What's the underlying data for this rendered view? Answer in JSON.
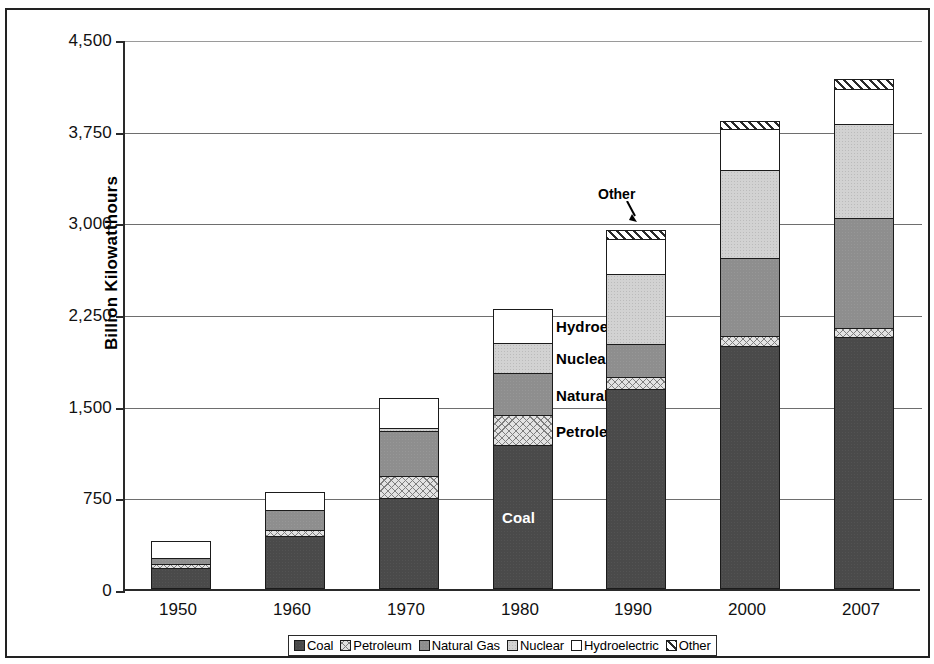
{
  "chart_data": {
    "type": "bar",
    "stacked": true,
    "title": "",
    "xlabel": "",
    "ylabel": "Billion Kilowatthours",
    "ylim": [
      0,
      4500
    ],
    "ytick_values": [
      0,
      750,
      1500,
      2250,
      3000,
      3750,
      4500
    ],
    "ytick_labels": [
      "0",
      "750",
      "1,500",
      "2,250",
      "3,000",
      "3,750",
      "4,500"
    ],
    "grid": true,
    "legend_position": "bottom",
    "categories": [
      "1950",
      "1960",
      "1970",
      "1980",
      "1990",
      "2000",
      "2007"
    ],
    "series": [
      {
        "name": "Coal",
        "values": [
          155,
          420,
          725,
          1160,
          1620,
          1970,
          2045
        ]
      },
      {
        "name": "Petroleum",
        "values": [
          35,
          50,
          185,
          245,
          100,
          85,
          75
        ]
      },
      {
        "name": "Natural Gas",
        "values": [
          45,
          160,
          370,
          345,
          265,
          635,
          900
        ]
      },
      {
        "name": "Nuclear",
        "values": [
          0,
          0,
          20,
          250,
          575,
          720,
          770
        ]
      },
      {
        "name": "Hydroelectric",
        "values": [
          140,
          145,
          245,
          275,
          290,
          335,
          285
        ]
      },
      {
        "name": "Other",
        "values": [
          0,
          0,
          0,
          0,
          70,
          70,
          85
        ]
      }
    ],
    "totals": [
      375,
      775,
      1545,
      2275,
      2920,
      3815,
      4160
    ],
    "annotations": [
      {
        "text": "Other",
        "target_category": "1990",
        "target_series": "Other"
      }
    ],
    "inline_labels": {
      "category": "1980",
      "labels": [
        "Coal",
        "Petroleum",
        "Natural Gas",
        "Nuclear",
        "Hydroelectric"
      ]
    }
  },
  "legend": {
    "items": [
      {
        "label": "Coal",
        "pattern": "solid-dark",
        "color": "#4a4a4a"
      },
      {
        "label": "Petroleum",
        "pattern": "cross-hatch",
        "color": "#e3e3e3"
      },
      {
        "label": "Natural Gas",
        "pattern": "solid-medium",
        "color": "#8e8e8e"
      },
      {
        "label": "Nuclear",
        "pattern": "stipple-light",
        "color": "#d2d2d2"
      },
      {
        "label": "Hydroelectric",
        "pattern": "empty",
        "color": "#ffffff"
      },
      {
        "label": "Other",
        "pattern": "diagonal-hatch",
        "color": "#ffffff"
      }
    ]
  }
}
